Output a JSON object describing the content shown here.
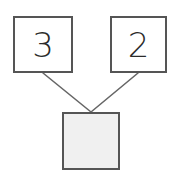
{
  "diagram": {
    "type": "number-bond",
    "background_color": "#ffffff",
    "border_color": "#555555",
    "line_color": "#666666",
    "digit_color": "#2b2b2b",
    "blank_fill_color": "#f0f0f0",
    "filled_fill_color": "#ffffff",
    "nodes": [
      {
        "id": "addend-left",
        "role": "addend",
        "value": "3",
        "filled": true,
        "x": 13,
        "y": 16,
        "width": 60,
        "height": 57
      },
      {
        "id": "addend-right",
        "role": "addend",
        "value": "2",
        "filled": true,
        "x": 110,
        "y": 16,
        "width": 57,
        "height": 57
      },
      {
        "id": "sum-box",
        "role": "sum",
        "value": "",
        "filled": false,
        "x": 62,
        "y": 112,
        "width": 58,
        "height": 58
      }
    ],
    "connectors": [
      {
        "id": "connector-left",
        "from": "addend-left",
        "to": "sum-box",
        "x1": 43,
        "y1": 73,
        "x2": 91,
        "y2": 112
      },
      {
        "id": "connector-right",
        "from": "addend-right",
        "to": "sum-box",
        "x1": 138,
        "y1": 73,
        "x2": 91,
        "y2": 112
      }
    ]
  }
}
